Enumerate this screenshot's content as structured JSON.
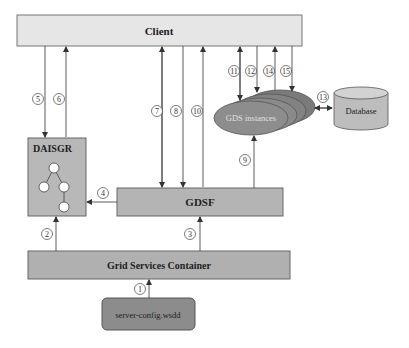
{
  "nodes": {
    "client": {
      "label": "Client"
    },
    "daisgr": {
      "label": "DAISGR"
    },
    "gdsf": {
      "label": "GDSF"
    },
    "gsc": {
      "label": "Grid Services Container"
    },
    "server_config": {
      "label": "server-config.wsdd"
    },
    "gds_instances": {
      "label": "GDS instances"
    },
    "database": {
      "label": "Database"
    }
  },
  "steps": [
    "1",
    "2",
    "3",
    "4",
    "5",
    "6",
    "7",
    "8",
    "9",
    "10",
    "11",
    "12",
    "13",
    "14",
    "15"
  ],
  "colors": {
    "client_fill": "#e6e6e6",
    "box_fill": "#b4b4b4",
    "dark_fill": "#8c8c8c",
    "ellipse_fill": "#8a8a8a",
    "db_fill": "#bdbdbd",
    "stroke": "#555555"
  }
}
